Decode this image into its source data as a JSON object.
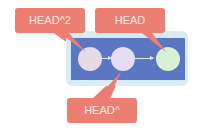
{
  "colors": {
    "container_outer": "#d8ecf8",
    "container_inner": "#5b77c4",
    "label_fill": "#ec7f72",
    "label_text": "#fbe9e6",
    "edge": "#dfe6f6"
  },
  "nodes": [
    {
      "id": "commit-1",
      "color": "#e6dae6"
    },
    {
      "id": "commit-2",
      "color": "#e2def0"
    },
    {
      "id": "commit-3",
      "color": "#d9f0d2"
    }
  ],
  "labels": {
    "head2": "HEAD^2",
    "head": "HEAD",
    "head1": "HEAD^"
  }
}
